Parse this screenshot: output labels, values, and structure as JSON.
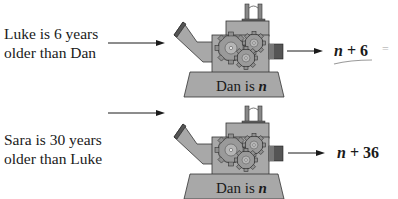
{
  "diagram": {
    "type": "function-machine",
    "rows": [
      {
        "input_label_line1": "Luke is 6 years",
        "input_label_line2": "older than Dan",
        "machine_label_prefix": "Dan is ",
        "machine_label_var": "n",
        "output_var": "n",
        "output_rest": " + 6",
        "annotation": "="
      },
      {
        "input_label_line1": "Sara is 30 years",
        "input_label_line2": "older than Luke",
        "machine_label_prefix": "Dan is ",
        "machine_label_var": "n",
        "output_var": "n",
        "output_rest": " + 36"
      }
    ],
    "colors": {
      "machine_body": "#a8a8a8",
      "machine_dark": "#555555",
      "gear": "#8f8f8f",
      "ink": "#1a1a1a",
      "pencil": "#9a9a9a"
    }
  }
}
